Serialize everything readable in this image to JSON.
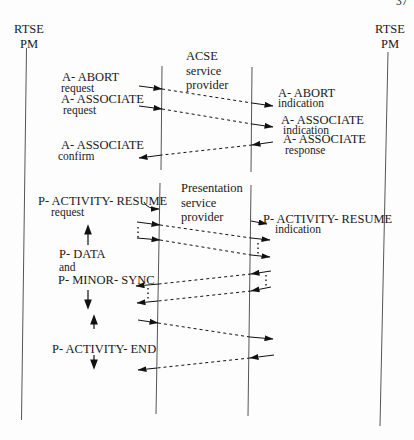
{
  "page_number": "37",
  "participants": {
    "left": {
      "line1": "RTSE",
      "line2": "PM"
    },
    "right": {
      "line1": "RTSE",
      "line2": "PM"
    },
    "acse": {
      "line1": "ACSE",
      "line2": "service",
      "line3": "provider"
    },
    "presentation": {
      "line1": "Presentation",
      "line2": "service",
      "line3": "provider"
    }
  },
  "acse_messages": {
    "abort_request": {
      "primitive": "A- ABORT",
      "type": "request"
    },
    "abort_indication": {
      "primitive": "A- ABORT",
      "type": "indication"
    },
    "associate_request": {
      "primitive": "A- ASSOCIATE",
      "type": "request"
    },
    "associate_indication": {
      "primitive": "A- ASSOCIATE",
      "type": "indication"
    },
    "associate_response": {
      "primitive": "A- ASSOCIATE",
      "type": "response"
    },
    "associate_confirm": {
      "primitive": "A- ASSOCIATE",
      "type": "confirm"
    }
  },
  "presentation_messages": {
    "resume_request": {
      "primitive": "P- ACTIVITY- RESUME",
      "type": "request"
    },
    "resume_indication": {
      "primitive": "P- ACTIVITY- RESUME",
      "type": "indication"
    },
    "data_sync": {
      "line1": "P- DATA",
      "line2": "and",
      "line3": "P- MINOR- SYNC"
    },
    "activity_end": {
      "primitive": "P- ACTIVITY- END"
    }
  },
  "colors": {
    "line": "#4a4a4a",
    "arrow": "#111111",
    "text": "#1a1a1a"
  }
}
